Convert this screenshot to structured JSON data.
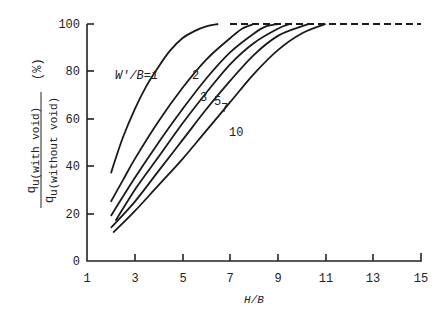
{
  "chart_data": {
    "type": "line",
    "title": "",
    "xlabel": "H/B",
    "ylabel": "q_u(with void) / q_u(without void) (%)",
    "ylabel_parts": {
      "numerator": "q",
      "numerator_sub": "u(with void)",
      "denominator": "q",
      "denominator_sub": "u(without void)",
      "unit": "(%)"
    },
    "xlim": [
      1,
      15
    ],
    "ylim": [
      0,
      100
    ],
    "xticks": [
      "1",
      "3",
      "5",
      "7",
      "9",
      "11",
      "13",
      "15"
    ],
    "yticks": [
      "0",
      "20",
      "40",
      "60",
      "80",
      "100"
    ],
    "grid": false,
    "legend": "inline curve labels",
    "curve_label_prefix": "W'/B=",
    "series": [
      {
        "name": "W'/B=1",
        "label": "W'/B=1",
        "x": [
          2,
          2.5,
          3,
          3.5,
          4,
          4.5,
          5,
          5.5,
          6,
          6.5
        ],
        "y": [
          37,
          52,
          64,
          74,
          82,
          89,
          94,
          97,
          99,
          100
        ]
      },
      {
        "name": "W'/B=2",
        "label": "2",
        "x": [
          2,
          2.5,
          3,
          4,
          5,
          6,
          7,
          7.5,
          8
        ],
        "y": [
          25,
          34,
          43,
          59,
          73,
          85,
          94,
          98,
          100
        ]
      },
      {
        "name": "W'/B=3",
        "label": "3",
        "x": [
          2,
          3,
          4,
          5,
          6,
          7,
          8,
          8.5,
          9
        ],
        "y": [
          19,
          35,
          50,
          64,
          77,
          88,
          96,
          99,
          100
        ]
      },
      {
        "name": "W'/B=5",
        "label": "5",
        "x": [
          2.2,
          3,
          4,
          5,
          6,
          7,
          8,
          9,
          9.5
        ],
        "y": [
          17,
          30,
          44,
          58,
          71,
          83,
          92,
          98,
          100
        ]
      },
      {
        "name": "W'/B=7",
        "label": "7",
        "x": [
          2,
          3,
          4,
          5,
          6,
          7,
          8,
          9,
          10,
          10.3
        ],
        "y": [
          14,
          25,
          38,
          51,
          64,
          76,
          87,
          95,
          99,
          100
        ]
      },
      {
        "name": "W'/B=10",
        "label": "10",
        "x": [
          2.1,
          3,
          4,
          5,
          6,
          7,
          8,
          9,
          10,
          11
        ],
        "y": [
          12,
          21,
          32,
          43,
          55,
          67,
          79,
          89,
          96,
          100
        ]
      }
    ],
    "annotations": [
      {
        "text": "dashed line at 100% from H/B≈6.5 to 15",
        "type": "asymptote"
      }
    ]
  }
}
